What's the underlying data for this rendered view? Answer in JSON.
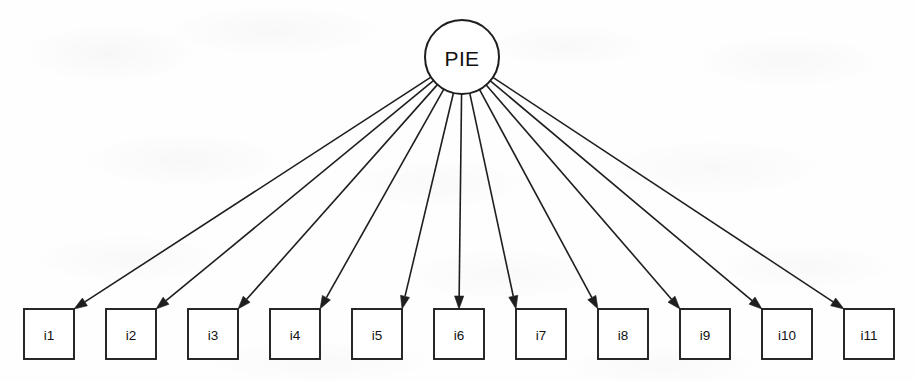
{
  "diagram": {
    "type": "star-radial-directed-graph",
    "background_color": "#fefefe",
    "stroke_color": "#1e1e1e",
    "root": {
      "id": "PIE",
      "label": "PIE",
      "shape": "circle",
      "cx": 462,
      "cy": 57,
      "r": 37
    },
    "leaf_shape": "rectangle",
    "leaf_width": 50,
    "leaf_height": 50,
    "leaf_top": 309,
    "leaf_pitch": 82,
    "leaf_first_left": 24,
    "leaves": [
      {
        "id": "i1",
        "label": "i1",
        "x": 24,
        "arrow_side": "top-right"
      },
      {
        "id": "i2",
        "label": "i2",
        "x": 106,
        "arrow_side": "top-right"
      },
      {
        "id": "i3",
        "label": "i3",
        "x": 188,
        "arrow_side": "top-right"
      },
      {
        "id": "i4",
        "label": "i4",
        "x": 270,
        "arrow_side": "top-right"
      },
      {
        "id": "i5",
        "label": "i5",
        "x": 352,
        "arrow_side": "top-right"
      },
      {
        "id": "i6",
        "label": "i6",
        "x": 434,
        "arrow_side": "top-center"
      },
      {
        "id": "i7",
        "label": "i7",
        "x": 516,
        "arrow_side": "top-left"
      },
      {
        "id": "i8",
        "label": "i8",
        "x": 598,
        "arrow_side": "top-left"
      },
      {
        "id": "i9",
        "label": "i9",
        "x": 680,
        "arrow_side": "top-left"
      },
      {
        "id": "i10",
        "label": "i10",
        "x": 762,
        "arrow_side": "top-left"
      },
      {
        "id": "i11",
        "label": "i11",
        "x": 844,
        "arrow_side": "top-left"
      }
    ],
    "edges": [
      {
        "from": "PIE",
        "to": "i1",
        "directed": true
      },
      {
        "from": "PIE",
        "to": "i2",
        "directed": true
      },
      {
        "from": "PIE",
        "to": "i3",
        "directed": true
      },
      {
        "from": "PIE",
        "to": "i4",
        "directed": true
      },
      {
        "from": "PIE",
        "to": "i5",
        "directed": true
      },
      {
        "from": "PIE",
        "to": "i6",
        "directed": true
      },
      {
        "from": "PIE",
        "to": "i7",
        "directed": true
      },
      {
        "from": "PIE",
        "to": "i8",
        "directed": true
      },
      {
        "from": "PIE",
        "to": "i9",
        "directed": true
      },
      {
        "from": "PIE",
        "to": "i10",
        "directed": true
      },
      {
        "from": "PIE",
        "to": "i11",
        "directed": true
      }
    ]
  }
}
